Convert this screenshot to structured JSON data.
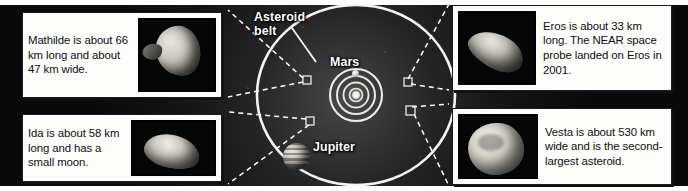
{
  "figure": {
    "background_color": "#0a0a0a",
    "orbit_color": "#f2f2f2",
    "leader_color": "#ffffff",
    "box_fill": "#fdfdfb",
    "box_border": "#1b1b1b",
    "text_color": "#0d0d0d"
  },
  "diagram": {
    "labels": {
      "asteroid_belt_line1": "Asteroid",
      "asteroid_belt_line2": "belt",
      "mars": "Mars",
      "jupiter": "Jupiter"
    },
    "bodies": [
      {
        "name": "sun-body",
        "label": ""
      },
      {
        "name": "mars-body",
        "label": "Mars"
      },
      {
        "name": "jupiter-body",
        "label": "Jupiter"
      }
    ],
    "inner_orbit_count": 4,
    "belt_marker_count": 4
  },
  "callouts": [
    {
      "id": "mathilde",
      "name": "Mathilde",
      "text": "Mathilde is about 66 km long and about 47 km wide.",
      "photo_alt": "mathilde-asteroid-photo",
      "photo_side": "right"
    },
    {
      "id": "ida",
      "name": "Ida",
      "text": "Ida is about 58 km long and has a small moon.",
      "photo_alt": "ida-asteroid-photo",
      "photo_side": "right"
    },
    {
      "id": "eros",
      "name": "Eros",
      "text": "Eros is about 33 km long. The NEAR space probe landed on Eros in 2001.",
      "photo_alt": "eros-asteroid-photo",
      "photo_side": "left"
    },
    {
      "id": "vesta",
      "name": "Vesta",
      "text": "Vesta is about 530 km wide and is the second-largest asteroid.",
      "photo_alt": "vesta-asteroid-photo",
      "photo_side": "left"
    }
  ]
}
